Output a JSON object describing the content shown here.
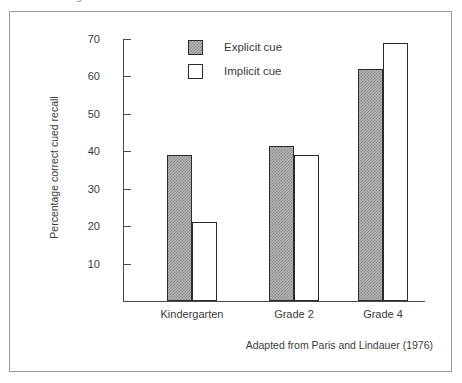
{
  "figure": {
    "scan_remnant_glyph": "ɔ",
    "source_note": "Adapted from Paris and Lindauer (1976)"
  },
  "legend": {
    "position": "top-center",
    "entries": [
      {
        "label": "Explicit cue",
        "swatch": "gray-hatched-swatch"
      },
      {
        "label": "Implicit cue",
        "swatch": "white-swatch"
      }
    ]
  },
  "chart_data": {
    "type": "bar",
    "title": "",
    "subtitle": "",
    "xlabel": "",
    "ylabel": "Percentage correct cued recall",
    "categories": [
      "Kindergarten",
      "Grade 2",
      "Grade 4"
    ],
    "series": [
      {
        "name": "Explicit cue",
        "values": [
          39,
          41.5,
          62
        ],
        "fill": "#b4b4b4",
        "pattern": "dither-gray"
      },
      {
        "name": "Implicit cue",
        "values": [
          21,
          39,
          69
        ],
        "fill": "#ffffff",
        "pattern": "none"
      }
    ],
    "ylim": [
      0,
      72
    ],
    "yticks": [
      10,
      20,
      30,
      40,
      50,
      60,
      70
    ],
    "ytick_labels": [
      "10",
      "20",
      "30",
      "40",
      "50",
      "60",
      "70"
    ],
    "grid": false,
    "legend_entries": [
      "Explicit cue",
      "Implicit cue"
    ],
    "annotations": [
      "Adapted from Paris and Lindauer (1976)"
    ],
    "axis_color": "#4a4a4a",
    "bar_edge_color": "#2b2b2b"
  }
}
